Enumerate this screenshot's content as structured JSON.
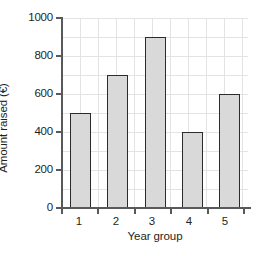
{
  "chart_data": {
    "type": "bar",
    "title": "",
    "xlabel": "Year group",
    "ylabel": "Amount raised (€)",
    "categories": [
      "1",
      "2",
      "3",
      "4",
      "5"
    ],
    "values": [
      500,
      700,
      900,
      400,
      600
    ],
    "ylim": [
      0,
      1000
    ],
    "ytick_labels": [
      "0",
      "200",
      "400",
      "600",
      "800",
      "1000"
    ],
    "ytick_values": [
      0,
      200,
      400,
      600,
      800,
      1000
    ],
    "minor_ytick_step": 100,
    "grid": true,
    "legend": null,
    "bar_fill_color": "#d9d9d9",
    "bar_edge_color": "#2b2b2b",
    "grid_color": "#e3e3e3",
    "axis_color": "#58595b",
    "background_color": "#ffffff"
  }
}
